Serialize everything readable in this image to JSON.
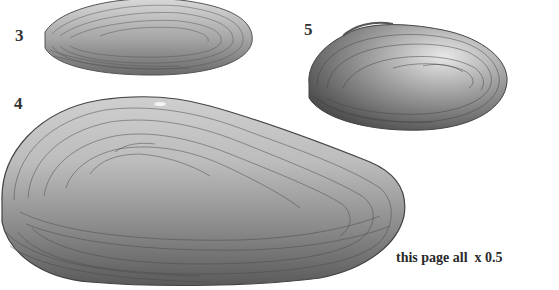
{
  "page": {
    "background": "#ffffff"
  },
  "figures": [
    {
      "label": "3",
      "description": "elongate mussel shell, upper left"
    },
    {
      "label": "4",
      "description": "large mussel shell, lower left"
    },
    {
      "label": "5",
      "description": "ovate mussel shell, upper right"
    }
  ],
  "caption": "this page all  x 0.5"
}
